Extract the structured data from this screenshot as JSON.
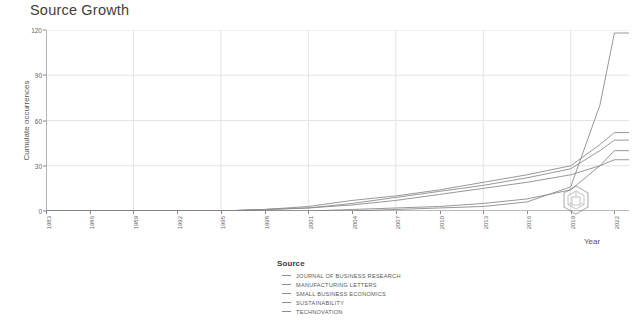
{
  "chart_data": {
    "type": "line",
    "title": "Source Growth",
    "xlabel": "Year",
    "ylabel": "Cumulate occurrences",
    "xlim": [
      1983,
      2023
    ],
    "ylim": [
      0,
      120
    ],
    "yticks": [
      0,
      30,
      60,
      90,
      120
    ],
    "xticks": [
      1983,
      1986,
      1989,
      1992,
      1995,
      1998,
      2001,
      2004,
      2007,
      2010,
      2013,
      2016,
      2019,
      2022
    ],
    "grid": true,
    "legend_title": "Source",
    "legend_position": "bottom",
    "x": [
      1983,
      1986,
      1989,
      1992,
      1995,
      1998,
      2001,
      2004,
      2007,
      2010,
      2013,
      2016,
      2019,
      2021,
      2022,
      2023
    ],
    "series": [
      {
        "name": "JOURNAL OF BUSINESS RESEARCH",
        "color": "#8c8c8c",
        "values": [
          0,
          0,
          0,
          0,
          0,
          0,
          0,
          0,
          1,
          2,
          3,
          6,
          16,
          70,
          118,
          118
        ]
      },
      {
        "name": "MANUFACTURING LETTERS",
        "color": "#8c8c8c",
        "values": [
          0,
          0,
          0,
          0,
          0,
          1,
          3,
          7,
          10,
          14,
          19,
          24,
          30,
          44,
          52,
          52
        ]
      },
      {
        "name": "SMALL BUSINESS ECONOMICS",
        "color": "#8c8c8c",
        "values": [
          0,
          0,
          0,
          0,
          0,
          1,
          2,
          5,
          9,
          13,
          17,
          22,
          28,
          40,
          47,
          47
        ]
      },
      {
        "name": "SUSTAINABILITY",
        "color": "#8c8c8c",
        "values": [
          0,
          0,
          0,
          0,
          0,
          0,
          0,
          1,
          2,
          3,
          5,
          8,
          14,
          30,
          40,
          40
        ]
      },
      {
        "name": "TECHNOVATION",
        "color": "#8c8c8c",
        "values": [
          0,
          0,
          0,
          0,
          0,
          1,
          2,
          4,
          7,
          11,
          15,
          19,
          24,
          30,
          34,
          34
        ]
      }
    ]
  },
  "legend": {
    "title": "Source",
    "items": [
      {
        "label": "JOURNAL OF BUSINESS RESEARCH"
      },
      {
        "label": "MANUFACTURING LETTERS"
      },
      {
        "label": "SMALL BUSINESS ECONOMICS"
      },
      {
        "label": "SUSTAINABILITY"
      },
      {
        "label": "TECHNOVATION"
      }
    ]
  },
  "watermark": {
    "name": "hexagon-watermark"
  }
}
